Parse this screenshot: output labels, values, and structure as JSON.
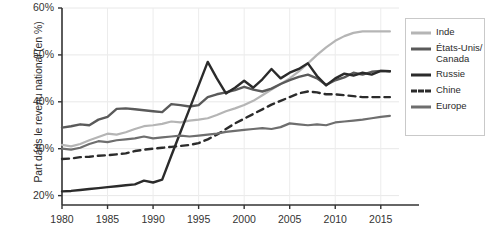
{
  "chart_data": {
    "type": "line",
    "title": "",
    "xlabel": "",
    "ylabel": "Part dans le revenu national (en %)",
    "xlim": [
      1980,
      2017
    ],
    "ylim": [
      18,
      60
    ],
    "grid": true,
    "legend_position": "right",
    "y_ticks": [
      "20%",
      "30%",
      "40%",
      "50%",
      "60%"
    ],
    "y_tick_values": [
      20,
      30,
      40,
      50,
      60
    ],
    "x_ticks": [
      "1980",
      "1985",
      "1990",
      "1995",
      "2000",
      "2005",
      "2010",
      "2015"
    ],
    "x_tick_values": [
      1980,
      1985,
      1990,
      1995,
      2000,
      2005,
      2010,
      2015
    ],
    "x": [
      1980,
      1981,
      1982,
      1983,
      1984,
      1985,
      1986,
      1987,
      1988,
      1989,
      1990,
      1991,
      1992,
      1993,
      1994,
      1995,
      1996,
      1997,
      1998,
      1999,
      2000,
      2001,
      2002,
      2003,
      2004,
      2005,
      2006,
      2007,
      2008,
      2009,
      2010,
      2011,
      2012,
      2013,
      2014,
      2015,
      2016
    ],
    "series": [
      {
        "name": "Inde",
        "color": "#b5b5b5",
        "style": "solid",
        "width": 2.2,
        "values": [
          30.8,
          30.5,
          31.0,
          31.8,
          32.5,
          33.2,
          33.0,
          33.5,
          34.2,
          34.8,
          35.0,
          35.3,
          35.8,
          35.6,
          36.0,
          36.2,
          36.5,
          37.2,
          38.0,
          38.6,
          39.3,
          40.2,
          41.4,
          42.6,
          43.8,
          45.0,
          46.5,
          48.2,
          50.0,
          51.6,
          53.0,
          54.0,
          54.7,
          55.0,
          55.0,
          55.0,
          55.0
        ]
      },
      {
        "name": "États-Unis/\nCanada",
        "color": "#5a5a5a",
        "style": "solid",
        "width": 2.4,
        "values": [
          34.5,
          34.8,
          35.2,
          35.0,
          36.2,
          36.8,
          38.5,
          38.6,
          38.4,
          38.2,
          38.0,
          37.8,
          39.5,
          39.3,
          39.0,
          39.3,
          41.0,
          41.6,
          42.0,
          42.5,
          43.2,
          42.6,
          42.2,
          42.8,
          43.8,
          44.6,
          45.3,
          45.8,
          45.0,
          43.6,
          44.6,
          45.2,
          46.2,
          45.8,
          46.4,
          46.6,
          46.5
        ]
      },
      {
        "name": "Russie",
        "color": "#2b2b2b",
        "style": "solid",
        "width": 2.4,
        "values": [
          20.9,
          21.0,
          21.2,
          21.4,
          21.6,
          21.8,
          22.0,
          22.2,
          22.4,
          23.2,
          22.8,
          23.4,
          28.5,
          33.5,
          38.5,
          43.5,
          48.5,
          45.0,
          41.8,
          43.0,
          44.5,
          43.0,
          44.8,
          47.0,
          45.0,
          46.2,
          47.0,
          48.2,
          45.5,
          43.5,
          45.0,
          46.0,
          45.6,
          46.2,
          45.8,
          46.6,
          46.5
        ]
      },
      {
        "name": "Chine",
        "color": "#2b2b2b",
        "style": "dashed",
        "width": 2.4,
        "values": [
          27.8,
          27.9,
          28.2,
          28.3,
          28.5,
          28.6,
          28.8,
          29.0,
          29.5,
          29.8,
          30.0,
          30.2,
          30.4,
          30.6,
          30.8,
          31.2,
          32.0,
          33.0,
          34.2,
          35.4,
          36.4,
          37.4,
          38.4,
          39.4,
          40.2,
          41.0,
          41.8,
          42.2,
          42.0,
          41.6,
          41.6,
          41.4,
          41.2,
          41.0,
          41.0,
          41.0,
          41.0
        ]
      },
      {
        "name": "Europe",
        "color": "#6e6e6e",
        "style": "solid",
        "width": 2.2,
        "values": [
          30.0,
          29.8,
          30.2,
          31.0,
          31.6,
          31.4,
          31.8,
          32.0,
          32.2,
          32.6,
          32.2,
          32.4,
          32.6,
          32.8,
          32.6,
          32.8,
          33.0,
          33.2,
          33.6,
          33.8,
          34.0,
          34.2,
          34.4,
          34.2,
          34.6,
          35.4,
          35.2,
          35.0,
          35.2,
          35.0,
          35.6,
          35.8,
          36.0,
          36.2,
          36.5,
          36.8,
          37.0
        ]
      }
    ]
  },
  "legend": {
    "items": [
      {
        "label": "Inde",
        "color": "#b5b5b5",
        "style": "solid"
      },
      {
        "label": "États-Unis/\nCanada",
        "color": "#5a5a5a",
        "style": "solid"
      },
      {
        "label": "Russie",
        "color": "#2b2b2b",
        "style": "solid"
      },
      {
        "label": "Chine",
        "color": "#2b2b2b",
        "style": "dashed"
      },
      {
        "label": "Europe",
        "color": "#6e6e6e",
        "style": "solid"
      }
    ]
  },
  "axis": {
    "y_title": "Part dans le revenu national (en %)"
  }
}
